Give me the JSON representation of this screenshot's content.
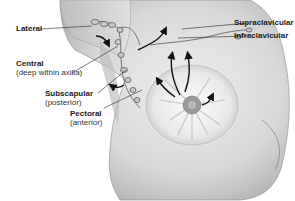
{
  "diagram": {
    "labels": {
      "lateral": {
        "title": "Lateral",
        "sub": ""
      },
      "central": {
        "title": "Central",
        "sub": "(deep within axilla)"
      },
      "subscapular": {
        "title": "Subscapular",
        "sub": "(posterior)"
      },
      "pectoral": {
        "title": "Pectoral",
        "sub": "(anterior)"
      },
      "supraclavicular": {
        "title": "Supraclavicular",
        "sub": ""
      },
      "infraclavicular": {
        "title": "Infraclavicular",
        "sub": ""
      }
    },
    "colors": {
      "skin_light": "#e6e6e6",
      "skin_shadow": "#9a9a9a",
      "gland": "#f2f2f2",
      "areola": "#8a8a8a",
      "arrow": "#111111",
      "leader_line": "#222222"
    }
  }
}
